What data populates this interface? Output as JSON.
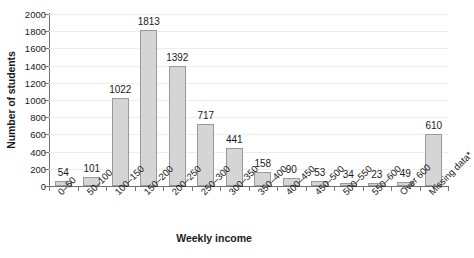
{
  "chart_data": {
    "type": "bar",
    "title": "",
    "xlabel": "Weekly income",
    "ylabel": "Number of students",
    "categories": [
      "0–50",
      "50–100",
      "100–150",
      "150–200",
      "200–250",
      "250–300",
      "300–350",
      "350–400",
      "400–450",
      "450–500",
      "500–550",
      "550–600",
      "Over 600",
      "Missing data*"
    ],
    "values": [
      54,
      101,
      1022,
      1813,
      1392,
      717,
      441,
      158,
      90,
      53,
      34,
      23,
      49,
      610
    ],
    "value_labels": [
      "54",
      "101",
      "1022",
      "1813",
      "1392",
      "717",
      "441",
      "158",
      "90",
      "53",
      "34",
      "23",
      "49",
      "610"
    ],
    "ylim": [
      0,
      2000
    ],
    "ytick_labels": [
      "0",
      "200",
      "400",
      "600",
      "800",
      "1000",
      "1200",
      "1400",
      "1600",
      "1800",
      "2000"
    ],
    "ytick_values": [
      0,
      200,
      400,
      600,
      800,
      1000,
      1200,
      1400,
      1600,
      1800,
      2000
    ],
    "grid": true,
    "legend": false,
    "bar_fill": "#d5d5d5",
    "bar_border": "#9a9a9a",
    "background": "#ffffff"
  }
}
